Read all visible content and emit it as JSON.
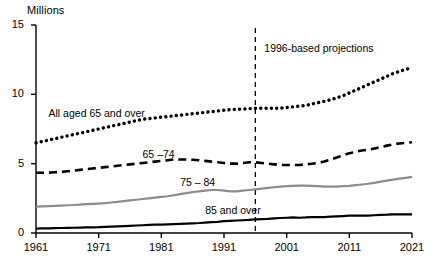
{
  "chart_data": {
    "type": "line",
    "title": "",
    "unit_label": "Millions",
    "xlabel": "",
    "ylabel": "",
    "xlim": [
      1961,
      2021
    ],
    "ylim": [
      0,
      15
    ],
    "yticks": [
      0,
      5,
      10,
      15
    ],
    "ytick_labels": [
      "0",
      "5",
      "10",
      "15"
    ],
    "xticks": [
      1961,
      1971,
      1981,
      1991,
      2001,
      2011,
      2021
    ],
    "xtick_labels": [
      "1961",
      "1971",
      "1981",
      "1991",
      "2001",
      "2011",
      "2021"
    ],
    "grid": false,
    "legend": "inline-annotations",
    "annotations": [
      {
        "name": "projection-divider",
        "text": "1996-based projections",
        "x": 1996,
        "type": "vertical-dashed-line"
      }
    ],
    "x": [
      1961,
      1962,
      1963,
      1964,
      1965,
      1966,
      1967,
      1968,
      1969,
      1970,
      1971,
      1972,
      1973,
      1974,
      1975,
      1976,
      1977,
      1978,
      1979,
      1980,
      1981,
      1982,
      1983,
      1984,
      1985,
      1986,
      1987,
      1988,
      1989,
      1990,
      1991,
      1992,
      1993,
      1994,
      1995,
      1996,
      1997,
      1998,
      1999,
      2000,
      2001,
      2002,
      2003,
      2004,
      2005,
      2006,
      2007,
      2008,
      2009,
      2010,
      2011,
      2012,
      2013,
      2014,
      2015,
      2016,
      2017,
      2018,
      2019,
      2020,
      2021
    ],
    "series": [
      {
        "name": "All aged 65 and over",
        "label": "All aged 65 and over",
        "style": "dotted",
        "color": "#000000",
        "label_x": 1963,
        "label_y": 8.6,
        "values": [
          6.5,
          6.6,
          6.7,
          6.8,
          6.9,
          7.0,
          7.1,
          7.2,
          7.3,
          7.4,
          7.5,
          7.6,
          7.7,
          7.8,
          7.9,
          8.0,
          8.1,
          8.2,
          8.25,
          8.3,
          8.35,
          8.4,
          8.45,
          8.5,
          8.55,
          8.6,
          8.65,
          8.7,
          8.75,
          8.8,
          8.85,
          8.9,
          8.92,
          8.94,
          8.96,
          9.0,
          9.0,
          9.0,
          9.0,
          9.0,
          9.05,
          9.1,
          9.15,
          9.2,
          9.3,
          9.4,
          9.5,
          9.6,
          9.75,
          9.9,
          10.1,
          10.3,
          10.5,
          10.7,
          10.9,
          11.1,
          11.3,
          11.5,
          11.65,
          11.8,
          11.9
        ]
      },
      {
        "name": "65-74",
        "label": "65 –74",
        "style": "dashed",
        "color": "#000000",
        "label_x": 1978,
        "label_y": 5.6,
        "values": [
          4.35,
          4.35,
          4.35,
          4.38,
          4.4,
          4.45,
          4.5,
          4.55,
          4.6,
          4.65,
          4.7,
          4.75,
          4.8,
          4.85,
          4.9,
          4.95,
          5.0,
          5.05,
          5.1,
          5.15,
          5.2,
          5.25,
          5.3,
          5.3,
          5.3,
          5.28,
          5.25,
          5.2,
          5.15,
          5.1,
          5.05,
          5.0,
          5.0,
          5.05,
          5.1,
          5.1,
          5.05,
          5.0,
          4.95,
          4.9,
          4.9,
          4.9,
          4.9,
          4.95,
          5.0,
          5.05,
          5.15,
          5.3,
          5.45,
          5.6,
          5.75,
          5.85,
          5.95,
          6.0,
          6.1,
          6.2,
          6.3,
          6.4,
          6.45,
          6.5,
          6.55
        ]
      },
      {
        "name": "75-84",
        "label": "75 – 84",
        "style": "solid",
        "color": "#8c8c8c",
        "label_x": 1984,
        "label_y": 3.6,
        "values": [
          1.9,
          1.92,
          1.94,
          1.96,
          1.98,
          2.0,
          2.02,
          2.05,
          2.08,
          2.1,
          2.12,
          2.15,
          2.2,
          2.25,
          2.3,
          2.35,
          2.4,
          2.45,
          2.5,
          2.55,
          2.6,
          2.65,
          2.72,
          2.8,
          2.88,
          2.95,
          3.0,
          3.05,
          3.1,
          3.1,
          3.05,
          3.0,
          3.0,
          3.05,
          3.1,
          3.15,
          3.2,
          3.25,
          3.3,
          3.35,
          3.38,
          3.4,
          3.42,
          3.42,
          3.4,
          3.38,
          3.35,
          3.35,
          3.35,
          3.38,
          3.4,
          3.45,
          3.5,
          3.55,
          3.62,
          3.7,
          3.78,
          3.85,
          3.92,
          3.98,
          4.05
        ]
      },
      {
        "name": "85 and over",
        "label": "85 and over",
        "style": "solid",
        "color": "#000000",
        "label_x": 1988,
        "label_y": 1.6,
        "values": [
          0.32,
          0.33,
          0.34,
          0.35,
          0.36,
          0.37,
          0.38,
          0.39,
          0.4,
          0.41,
          0.42,
          0.44,
          0.46,
          0.48,
          0.5,
          0.52,
          0.54,
          0.56,
          0.58,
          0.6,
          0.6,
          0.62,
          0.64,
          0.66,
          0.68,
          0.7,
          0.72,
          0.75,
          0.78,
          0.8,
          0.85,
          0.88,
          0.9,
          0.92,
          0.95,
          0.98,
          1.0,
          1.02,
          1.05,
          1.08,
          1.1,
          1.12,
          1.1,
          1.12,
          1.15,
          1.15,
          1.15,
          1.18,
          1.2,
          1.22,
          1.25,
          1.25,
          1.25,
          1.26,
          1.28,
          1.3,
          1.32,
          1.35,
          1.35,
          1.35,
          1.35
        ]
      }
    ]
  }
}
